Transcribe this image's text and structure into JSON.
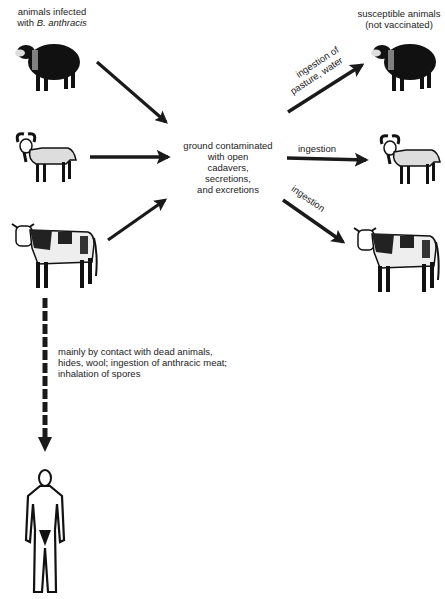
{
  "diagram": {
    "type": "flow",
    "labels": {
      "source_title_line1": "animals infected",
      "source_title_line2_prefix": "with ",
      "source_title_line2_italic": "B. anthracis",
      "target_title_line1": "susceptible animals",
      "target_title_line2": "(not vaccinated)",
      "hub_lines": [
        "ground contaminated",
        "with open",
        "cadavers,",
        "secretions,",
        "and excretions"
      ],
      "edge_sheep_out_line1": "ingestion of",
      "edge_sheep_out_line2": "pasture, water",
      "edge_goat_out": "ingestion",
      "edge_cow_out": "ingestion",
      "human_route_lines": [
        "mainly by contact with dead animals,",
        "hides, wool; ingestion of anthracic meat;",
        "inhalation of spores"
      ]
    },
    "nodes": [
      {
        "id": "infected-sheep",
        "kind": "sheep",
        "group": "source"
      },
      {
        "id": "infected-goat",
        "kind": "goat",
        "group": "source"
      },
      {
        "id": "infected-cow",
        "kind": "cow",
        "group": "source"
      },
      {
        "id": "contaminated-ground",
        "kind": "text",
        "group": "hub"
      },
      {
        "id": "susceptible-sheep",
        "kind": "sheep",
        "group": "target"
      },
      {
        "id": "susceptible-goat",
        "kind": "goat",
        "group": "target"
      },
      {
        "id": "susceptible-cow",
        "kind": "cow",
        "group": "target"
      },
      {
        "id": "human",
        "kind": "human",
        "group": "target"
      }
    ],
    "edges": [
      {
        "from": "infected-sheep",
        "to": "contaminated-ground",
        "style": "solid"
      },
      {
        "from": "infected-goat",
        "to": "contaminated-ground",
        "style": "solid"
      },
      {
        "from": "infected-cow",
        "to": "contaminated-ground",
        "style": "solid"
      },
      {
        "from": "contaminated-ground",
        "to": "susceptible-sheep",
        "style": "solid",
        "label": "ingestion of pasture, water"
      },
      {
        "from": "contaminated-ground",
        "to": "susceptible-goat",
        "style": "solid",
        "label": "ingestion"
      },
      {
        "from": "contaminated-ground",
        "to": "susceptible-cow",
        "style": "solid",
        "label": "ingestion"
      },
      {
        "from": "infected-cow",
        "to": "human",
        "style": "dashed",
        "label": "mainly by contact with dead animals, hides, wool; ingestion of anthracic meat; inhalation of spores"
      }
    ],
    "colors": {
      "ink": "#1a1a1a",
      "background": "#ffffff"
    }
  }
}
